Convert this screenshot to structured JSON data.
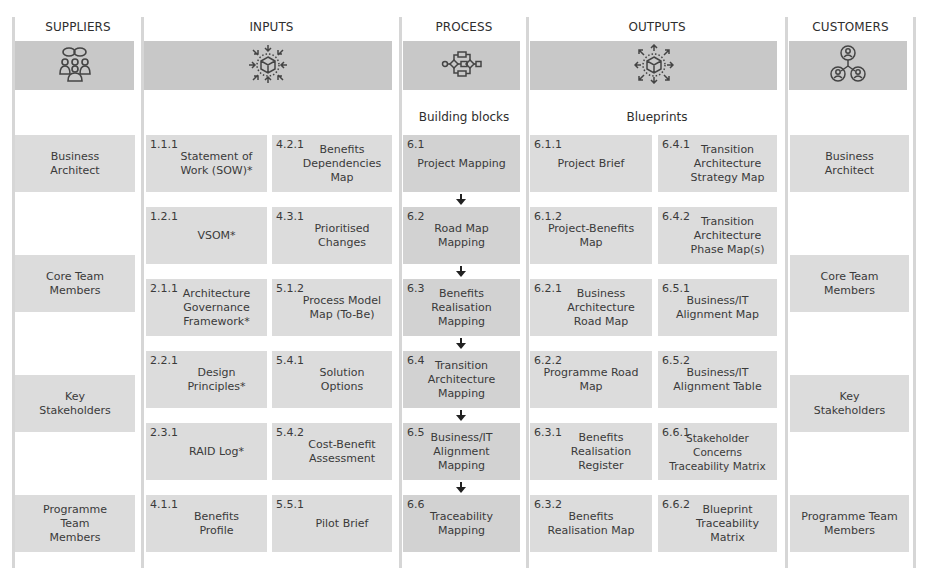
{
  "columns": [
    {
      "id": "suppliers",
      "title": "SUPPLIERS",
      "icon": "people-group-icon"
    },
    {
      "id": "inputs",
      "title": "INPUTS",
      "icon": "cube-inward-arrows-icon"
    },
    {
      "id": "process",
      "title": "PROCESS",
      "icon": "process-flow-icon"
    },
    {
      "id": "outputs",
      "title": "OUTPUTS",
      "icon": "cube-outward-arrows-icon"
    },
    {
      "id": "customers",
      "title": "CUSTOMERS",
      "icon": "connected-users-icon"
    }
  ],
  "subheads": {
    "process": "Building blocks",
    "outputs": "Blueprints"
  },
  "suppliers": [
    {
      "label": "Business\nArchitect"
    },
    {
      "label": "Core Team\nMembers"
    },
    {
      "label": "Key\nStakeholders"
    },
    {
      "label": "Programme\nTeam\nMembers"
    }
  ],
  "inputs": [
    {
      "num": "1.1.1",
      "label": "Statement of\nWork (SOW)*"
    },
    {
      "num": "4.2.1",
      "label": "Benefits\nDependencies\nMap"
    },
    {
      "num": "1.2.1",
      "label": "VSOM*"
    },
    {
      "num": "4.3.1",
      "label": "Prioritised\nChanges"
    },
    {
      "num": "2.1.1",
      "label": "Architecture\nGovernance\nFramework*"
    },
    {
      "num": "5.1.2",
      "label": "Process Model\nMap (To-Be)"
    },
    {
      "num": "2.2.1",
      "label": "Design\nPrinciples*"
    },
    {
      "num": "5.4.1",
      "label": "Solution\nOptions"
    },
    {
      "num": "2.3.1",
      "label": "RAID Log*"
    },
    {
      "num": "5.4.2",
      "label": "Cost-Benefit\nAssessment"
    },
    {
      "num": "4.1.1",
      "label": "Benefits\nProfile"
    },
    {
      "num": "5.5.1",
      "label": "Pilot Brief"
    }
  ],
  "process": [
    {
      "num": "6.1",
      "label": "Project Mapping"
    },
    {
      "num": "6.2",
      "label": "Road Map\nMapping"
    },
    {
      "num": "6.3",
      "label": "Benefits\nRealisation\nMapping"
    },
    {
      "num": "6.4",
      "label": "Transition\nArchitecture\nMapping"
    },
    {
      "num": "6.5",
      "label": "Business/IT\nAlignment\nMapping"
    },
    {
      "num": "6.6",
      "label": "Traceability\nMapping"
    }
  ],
  "outputs": [
    {
      "num": "6.1.1",
      "label": "Project Brief"
    },
    {
      "num": "6.4.1",
      "label": "Transition\nArchitecture\nStrategy Map"
    },
    {
      "num": "6.1.2",
      "label": "Project-Benefits\nMap"
    },
    {
      "num": "6.4.2",
      "label": "Transition\nArchitecture\nPhase Map(s)"
    },
    {
      "num": "6.2.1",
      "label": "Business\nArchitecture\nRoad Map"
    },
    {
      "num": "6.5.1",
      "label": "Business/IT\nAlignment Map"
    },
    {
      "num": "6.2.2",
      "label": "Programme Road\nMap"
    },
    {
      "num": "6.5.2",
      "label": "Business/IT\nAlignment Table"
    },
    {
      "num": "6.3.1",
      "label": "Benefits\nRealisation\nRegister"
    },
    {
      "num": "6.6.1",
      "label": "Stakeholder\nConcerns\nTraceability Matrix"
    },
    {
      "num": "6.3.2",
      "label": "Benefits\nRealisation Map"
    },
    {
      "num": "6.6.2",
      "label": "Blueprint\nTraceability\nMatrix"
    }
  ],
  "customers": [
    {
      "label": "Business\nArchitect"
    },
    {
      "label": "Core Team\nMembers"
    },
    {
      "label": "Key\nStakeholders"
    },
    {
      "label": "Programme Team\nMembers"
    }
  ],
  "colors": {
    "band": "#c8c8c8",
    "box": "#dcdcdc",
    "process_box": "#d2d2d2",
    "separator": "#d6d6d6",
    "text": "#333333"
  }
}
